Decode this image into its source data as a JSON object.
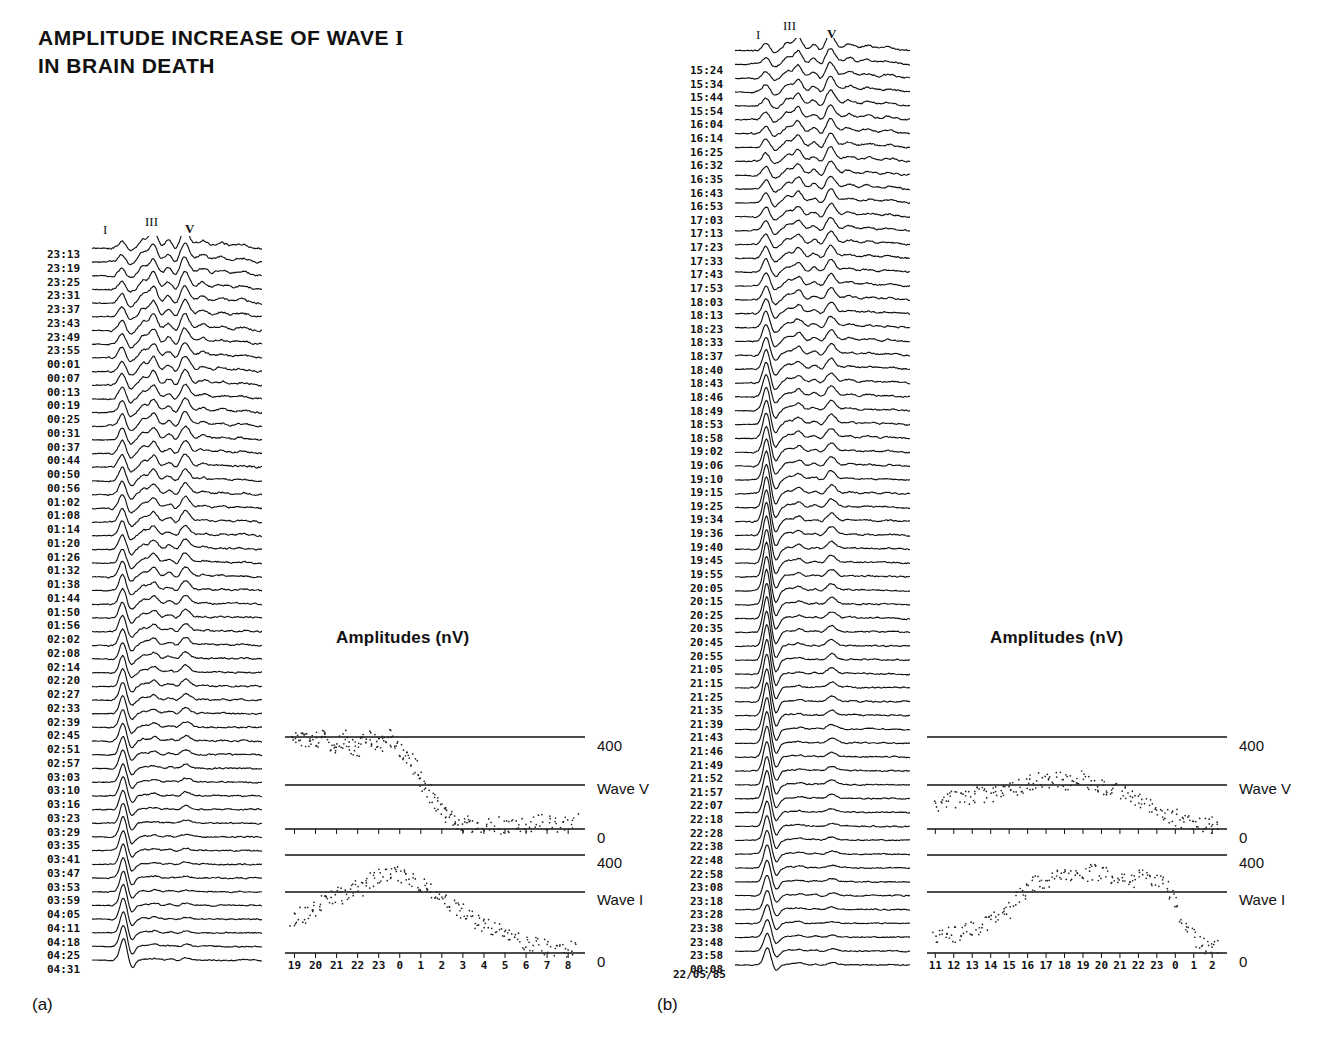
{
  "figure": {
    "title_line1": "AMPLITUDE INCREASE OF WAVE I",
    "title_line1_wave": "I",
    "title_line2": "IN BRAIN DEATH",
    "panel_a_letter": "(a)",
    "panel_b_letter": "(b)"
  },
  "wave_markers": {
    "one": "I",
    "three": "III",
    "five": "V"
  },
  "amplitude": {
    "title": "Amplitudes (nV)",
    "top_400": "400",
    "wave_v": "Wave V",
    "mid_0": "0",
    "lower_400": "400",
    "wave_i": "Wave I",
    "bottom_0": "0"
  },
  "panel_a": {
    "letter": "(a)",
    "amp_title": "Amplitudes (nV)",
    "x_ticks": [
      "19",
      "20",
      "21",
      "22",
      "23",
      "0",
      "1",
      "2",
      "3",
      "4",
      "5",
      "6",
      "7",
      "8"
    ],
    "times": [
      "23:13",
      "23:19",
      "23:25",
      "23:31",
      "23:37",
      "23:43",
      "23:49",
      "23:55",
      "00:01",
      "00:07",
      "00:13",
      "00:19",
      "00:25",
      "00:31",
      "00:37",
      "00:44",
      "00:50",
      "00:56",
      "01:02",
      "01:08",
      "01:14",
      "01:20",
      "01:26",
      "01:32",
      "01:38",
      "01:44",
      "01:50",
      "01:56",
      "02:02",
      "02:08",
      "02:14",
      "02:20",
      "02:27",
      "02:33",
      "02:39",
      "02:45",
      "02:51",
      "02:57",
      "03:03",
      "03:10",
      "03:16",
      "03:23",
      "03:29",
      "03:35",
      "03:41",
      "03:47",
      "03:53",
      "03:59",
      "04:05",
      "04:11",
      "04:18",
      "04:25",
      "04:31"
    ]
  },
  "panel_b": {
    "letter": "(b)",
    "amp_title": "Amplitudes (nV)",
    "date": "22/05/85",
    "x_ticks": [
      "11",
      "12",
      "13",
      "14",
      "15",
      "16",
      "17",
      "18",
      "19",
      "20",
      "21",
      "22",
      "23",
      "0",
      "1",
      "2"
    ],
    "times": [
      "15:24",
      "15:34",
      "15:44",
      "15:54",
      "16:04",
      "16:14",
      "16:25",
      "16:32",
      "16:35",
      "16:43",
      "16:53",
      "17:03",
      "17:13",
      "17:23",
      "17:33",
      "17:43",
      "17:53",
      "18:03",
      "18:13",
      "18:23",
      "18:33",
      "18:37",
      "18:40",
      "18:43",
      "18:46",
      "18:49",
      "18:53",
      "18:58",
      "19:02",
      "19:06",
      "19:10",
      "19:15",
      "19:25",
      "19:34",
      "19:36",
      "19:40",
      "19:45",
      "19:55",
      "20:05",
      "20:15",
      "20:25",
      "20:35",
      "20:45",
      "20:55",
      "21:05",
      "21:15",
      "21:25",
      "21:35",
      "21:39",
      "21:43",
      "21:46",
      "21:49",
      "21:52",
      "21:57",
      "22:07",
      "22:18",
      "22:28",
      "22:38",
      "22:48",
      "22:58",
      "23:08",
      "23:18",
      "23:28",
      "23:38",
      "23:48",
      "23:58",
      "00:08"
    ]
  },
  "chart_data": [
    {
      "type": "line",
      "name": "panel-a-waterfall",
      "title": "BAEP waterfall, patient (a)",
      "xlabel": "latency (ms)",
      "ylabel": "successive recordings (time of day)",
      "n_traces": 53,
      "trace_labels": [
        "23:13",
        "23:19",
        "23:25",
        "23:31",
        "23:37",
        "23:43",
        "23:49",
        "23:55",
        "00:01",
        "00:07",
        "00:13",
        "00:19",
        "00:25",
        "00:31",
        "00:37",
        "00:44",
        "00:50",
        "00:56",
        "01:02",
        "01:08",
        "01:14",
        "01:20",
        "01:26",
        "01:32",
        "01:38",
        "01:44",
        "01:50",
        "01:56",
        "02:02",
        "02:08",
        "02:14",
        "02:20",
        "02:27",
        "02:33",
        "02:39",
        "02:45",
        "02:51",
        "02:57",
        "03:03",
        "03:10",
        "03:16",
        "03:23",
        "03:29",
        "03:35",
        "03:41",
        "03:47",
        "03:53",
        "03:59",
        "04:05",
        "04:11",
        "04:18",
        "04:25",
        "04:31"
      ],
      "annotations": [
        "I",
        "III",
        "V"
      ],
      "grid": false
    },
    {
      "type": "scatter",
      "name": "panel-a-wave-v-amplitude",
      "title": "Amplitudes (nV)",
      "series_name": "Wave V",
      "xlabel": "hour of day",
      "ylabel": "Amplitude (nV)",
      "ylim": [
        0,
        400
      ],
      "yticks": [
        0,
        400
      ],
      "xticks": [
        "19",
        "20",
        "21",
        "22",
        "23",
        "0",
        "1",
        "2",
        "3",
        "4",
        "5",
        "6",
        "7",
        "8"
      ],
      "x": [
        19.0,
        19.3,
        19.6,
        19.9,
        20.2,
        20.5,
        20.8,
        21.1,
        21.4,
        21.7,
        22.0,
        22.3,
        22.6,
        22.9,
        23.2,
        23.5,
        23.8,
        24.1,
        24.4,
        24.7,
        25.0,
        25.3,
        25.6,
        25.9,
        26.2,
        26.5,
        26.8,
        27.1,
        27.5,
        28.0,
        28.5,
        29.0,
        29.5,
        30.0,
        30.5,
        31.0,
        31.5,
        32.0
      ],
      "y": [
        395,
        400,
        380,
        370,
        390,
        400,
        355,
        380,
        395,
        365,
        345,
        390,
        400,
        370,
        380,
        400,
        360,
        330,
        300,
        250,
        200,
        150,
        110,
        70,
        45,
        30,
        25,
        20,
        18,
        22,
        15,
        20,
        25,
        18,
        30,
        22,
        28,
        35
      ],
      "grid": false
    },
    {
      "type": "scatter",
      "name": "panel-a-wave-i-amplitude",
      "title": "Amplitudes (nV)",
      "series_name": "Wave I",
      "xlabel": "hour of day",
      "ylabel": "Amplitude (nV)",
      "ylim": [
        0,
        400
      ],
      "yticks": [
        0,
        400
      ],
      "xticks": [
        "19",
        "20",
        "21",
        "22",
        "23",
        "0",
        "1",
        "2",
        "3",
        "4",
        "5",
        "6",
        "7",
        "8"
      ],
      "x": [
        19.0,
        19.4,
        19.8,
        20.2,
        20.6,
        21.0,
        21.4,
        21.8,
        22.2,
        22.6,
        23.0,
        23.4,
        23.8,
        24.2,
        24.6,
        25.0,
        25.4,
        25.8,
        26.2,
        26.6,
        27.0,
        27.4,
        27.8,
        28.2,
        28.6,
        29.0,
        29.5,
        30.0,
        30.5,
        31.0,
        31.5,
        32.0
      ],
      "y": [
        120,
        160,
        150,
        190,
        210,
        240,
        230,
        270,
        260,
        300,
        320,
        310,
        330,
        300,
        290,
        280,
        250,
        230,
        200,
        180,
        150,
        130,
        110,
        95,
        80,
        60,
        40,
        30,
        25,
        20,
        18,
        15
      ],
      "grid": false
    },
    {
      "type": "line",
      "name": "panel-b-waterfall",
      "title": "BAEP waterfall, patient (b)",
      "xlabel": "latency (ms)",
      "ylabel": "successive recordings (time of day)",
      "n_traces": 67,
      "trace_labels": [
        "15:24",
        "15:34",
        "15:44",
        "15:54",
        "16:04",
        "16:14",
        "16:25",
        "16:32",
        "16:35",
        "16:43",
        "16:53",
        "17:03",
        "17:13",
        "17:23",
        "17:33",
        "17:43",
        "17:53",
        "18:03",
        "18:13",
        "18:23",
        "18:33",
        "18:37",
        "18:40",
        "18:43",
        "18:46",
        "18:49",
        "18:53",
        "18:58",
        "19:02",
        "19:06",
        "19:10",
        "19:15",
        "19:25",
        "19:34",
        "19:36",
        "19:40",
        "19:45",
        "19:55",
        "20:05",
        "20:15",
        "20:25",
        "20:35",
        "20:45",
        "20:55",
        "21:05",
        "21:15",
        "21:25",
        "21:35",
        "21:39",
        "21:43",
        "21:46",
        "21:49",
        "21:52",
        "21:57",
        "22:07",
        "22:18",
        "22:28",
        "22:38",
        "22:48",
        "22:58",
        "23:08",
        "23:18",
        "23:28",
        "23:38",
        "23:48",
        "23:58",
        "00:08"
      ],
      "annotations": [
        "I",
        "III",
        "V"
      ],
      "grid": false
    },
    {
      "type": "scatter",
      "name": "panel-b-wave-v-amplitude",
      "title": "Amplitudes (nV)",
      "series_name": "Wave V",
      "xlabel": "hour of day",
      "ylabel": "Amplitude (nV)",
      "ylim": [
        0,
        400
      ],
      "yticks": [
        0,
        400
      ],
      "xticks": [
        "11",
        "12",
        "13",
        "14",
        "15",
        "16",
        "17",
        "18",
        "19",
        "20",
        "21",
        "22",
        "23",
        "0",
        "1",
        "2"
      ],
      "x": [
        11.0,
        11.5,
        12.0,
        12.5,
        13.0,
        13.5,
        14.0,
        14.5,
        15.0,
        15.5,
        16.0,
        16.5,
        17.0,
        17.5,
        18.0,
        18.5,
        19.0,
        19.5,
        20.0,
        20.5,
        21.0,
        21.5,
        22.0,
        22.5,
        23.0,
        23.5,
        24.0,
        24.5,
        25.0,
        25.5,
        26.0
      ],
      "y": [
        110,
        120,
        130,
        125,
        140,
        150,
        145,
        160,
        170,
        185,
        195,
        210,
        200,
        215,
        205,
        220,
        210,
        195,
        185,
        170,
        150,
        130,
        110,
        90,
        70,
        55,
        40,
        30,
        22,
        18,
        12
      ],
      "grid": false
    },
    {
      "type": "scatter",
      "name": "panel-b-wave-i-amplitude",
      "title": "Amplitudes (nV)",
      "series_name": "Wave I",
      "xlabel": "hour of day",
      "ylabel": "Amplitude (nV)",
      "ylim": [
        0,
        400
      ],
      "yticks": [
        0,
        400
      ],
      "xticks": [
        "11",
        "12",
        "13",
        "14",
        "15",
        "16",
        "17",
        "18",
        "19",
        "20",
        "21",
        "22",
        "23",
        "0",
        "1",
        "2"
      ],
      "x": [
        11.0,
        11.5,
        12.0,
        12.5,
        13.0,
        13.5,
        14.0,
        14.5,
        15.0,
        15.5,
        16.0,
        16.5,
        17.0,
        17.5,
        18.0,
        18.5,
        19.0,
        19.5,
        20.0,
        20.5,
        21.0,
        21.5,
        22.0,
        22.5,
        23.0,
        23.5,
        24.0,
        24.5,
        25.0,
        25.5,
        26.0
      ],
      "y": [
        60,
        75,
        70,
        90,
        100,
        110,
        130,
        150,
        180,
        230,
        270,
        290,
        300,
        310,
        320,
        315,
        325,
        330,
        320,
        315,
        310,
        300,
        305,
        295,
        280,
        230,
        150,
        80,
        40,
        25,
        15
      ],
      "grid": false
    }
  ]
}
